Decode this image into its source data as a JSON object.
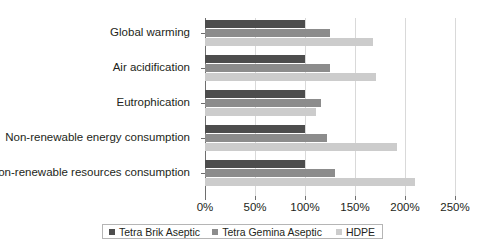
{
  "chart_data": {
    "type": "bar",
    "orientation": "horizontal",
    "title": "",
    "subtitle": "",
    "xlabel": "",
    "ylabel": "",
    "xlim": [
      0,
      250
    ],
    "xticks": [
      "0%",
      "50%",
      "100%",
      "150%",
      "200%",
      "250%"
    ],
    "xtick_values": [
      0,
      50,
      100,
      150,
      200,
      250
    ],
    "grid": true,
    "legend_position": "bottom",
    "categories": [
      "Global warming",
      "Air acidification",
      "Eutrophication",
      "Non-renewable energy consumption",
      "Non-renewable resources consumption"
    ],
    "series": [
      {
        "name": "Tetra Brik Aseptic",
        "color": "#4d4d4d",
        "values": [
          100,
          100,
          100,
          100,
          100
        ]
      },
      {
        "name": "Tetra Gemina Aseptic",
        "color": "#8c8c8c",
        "values": [
          125,
          125,
          116,
          122,
          130
        ]
      },
      {
        "name": "HDPE",
        "color": "#cccccc",
        "values": [
          168,
          171,
          111,
          192,
          210
        ]
      }
    ]
  },
  "colors": {
    "axis": "#6e6e6e",
    "gridline": "#d9d9d9",
    "text": "#231f20",
    "legend_border": "#b5b5b5",
    "background": "#ffffff"
  }
}
